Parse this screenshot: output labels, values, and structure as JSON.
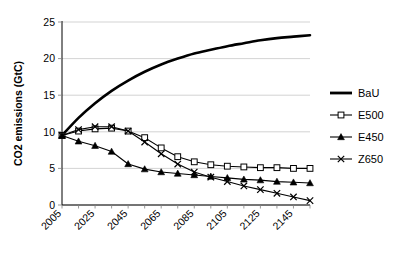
{
  "chart_data": {
    "type": "line",
    "title": "",
    "xlabel": "",
    "ylabel": "CO2 emissions (GtC)",
    "xlim": [
      2005,
      2155
    ],
    "ylim": [
      0,
      25
    ],
    "yticks": [
      0,
      5,
      10,
      15,
      20,
      25
    ],
    "ytick_labels": [
      "0",
      "5",
      "10",
      "15",
      "20",
      "25"
    ],
    "xticks": [
      2005,
      2025,
      2045,
      2065,
      2085,
      2105,
      2125,
      2145
    ],
    "xtick_labels": [
      "2005",
      "2025",
      "2045",
      "2065",
      "2085",
      "2105",
      "2125",
      "2145"
    ],
    "x_minor_step": 10,
    "grid": "horizontal",
    "legend_position": "right",
    "x": [
      2005,
      2015,
      2025,
      2035,
      2045,
      2055,
      2065,
      2075,
      2085,
      2095,
      2105,
      2115,
      2125,
      2135,
      2145,
      2155
    ],
    "series": [
      {
        "name": "BaU",
        "marker": "none",
        "linewidth": 2.6,
        "color": "#000000",
        "values": [
          9.5,
          11.9,
          13.9,
          15.6,
          17.0,
          18.2,
          19.2,
          20.0,
          20.7,
          21.2,
          21.7,
          22.1,
          22.5,
          22.8,
          23.0,
          23.2
        ]
      },
      {
        "name": "E500",
        "marker": "open-square",
        "linewidth": 1.1,
        "color": "#000000",
        "values": [
          9.5,
          10.1,
          10.4,
          10.5,
          10.1,
          9.2,
          7.8,
          6.6,
          5.9,
          5.5,
          5.3,
          5.2,
          5.1,
          5.1,
          5.0,
          5.0
        ]
      },
      {
        "name": "E450",
        "marker": "filled-triangle",
        "linewidth": 1.1,
        "color": "#000000",
        "values": [
          9.5,
          8.7,
          8.1,
          7.3,
          5.6,
          4.9,
          4.5,
          4.3,
          4.1,
          3.9,
          3.7,
          3.5,
          3.4,
          3.2,
          3.1,
          3.0
        ]
      },
      {
        "name": "Z650",
        "marker": "x-cross",
        "linewidth": 1.1,
        "color": "#000000",
        "values": [
          9.5,
          10.3,
          10.7,
          10.7,
          10.1,
          8.6,
          7.0,
          5.6,
          4.5,
          3.8,
          3.2,
          2.6,
          2.1,
          1.6,
          1.1,
          0.6
        ]
      }
    ],
    "legend": [
      {
        "label": "BaU",
        "marker": "none"
      },
      {
        "label": "E500",
        "marker": "open-square"
      },
      {
        "label": "E450",
        "marker": "filled-triangle"
      },
      {
        "label": "Z650",
        "marker": "x-cross"
      }
    ]
  }
}
